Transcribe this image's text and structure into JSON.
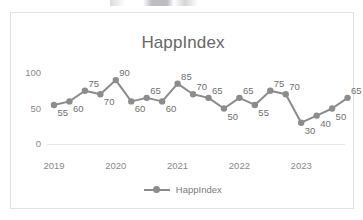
{
  "chart_data": {
    "type": "line",
    "title": "HappIndex",
    "xlabel": "",
    "ylabel": "",
    "ylim": [
      0,
      100
    ],
    "yticks": [
      0,
      50,
      100
    ],
    "grid": false,
    "legend_position": "bottom",
    "series_color": "#8c8c8c",
    "x_tick_labels": [
      "2019",
      "2020",
      "2021",
      "2022",
      "2023"
    ],
    "series": [
      {
        "name": "HappIndex",
        "values": [
          55,
          60,
          75,
          70,
          90,
          60,
          65,
          60,
          85,
          70,
          65,
          50,
          65,
          55,
          75,
          70,
          30,
          40,
          50,
          65
        ],
        "data_labels": [
          "55",
          "60",
          "75",
          "70",
          "90",
          "60",
          "65",
          "60",
          "85",
          "70",
          "65",
          "50",
          "65",
          "55",
          "75",
          "70",
          "30",
          "40",
          "50",
          "65"
        ]
      }
    ]
  },
  "legend": {
    "entries": [
      "HappIndex"
    ]
  }
}
